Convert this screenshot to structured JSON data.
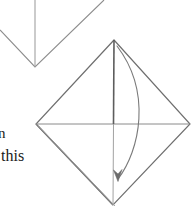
{
  "page": {
    "background_color": "#ffffff",
    "width": 195,
    "height": 208
  },
  "caption": {
    "line_1": "n",
    "line_2": "this",
    "color": "#1a1a1a",
    "note": "clipped caption text at left edge"
  },
  "figures": {
    "previous_step": {
      "name": "partial-figure-top-left",
      "description": "bottom tip of preceding diagram: V shape with vertical crease line",
      "stroke_color": "#8a8a8a",
      "v_left_end": [
        0,
        30
      ],
      "v_apex": [
        35,
        67
      ],
      "v_right_end": [
        104,
        0
      ],
      "crease_top": [
        35,
        0
      ],
      "crease_bottom": [
        35,
        67
      ]
    },
    "main_figure": {
      "name": "diamond-square",
      "description": "rotated square (diamond) with horizontal and vertical center creases and doubled lower-left edge",
      "stroke_color": "#6f6f6f",
      "crease_color": "#8f8f8f",
      "vertex_top": [
        114,
        40
      ],
      "vertex_right": [
        190,
        124
      ],
      "vertex_bottom": [
        113,
        205
      ],
      "vertex_left": [
        36,
        124
      ],
      "horizontal_crease": [
        [
          36,
          124
        ],
        [
          190,
          124
        ]
      ],
      "vertical_crease": [
        [
          114,
          40
        ],
        [
          113,
          205
        ]
      ],
      "doubled_edge": "lower-left"
    },
    "fold_arrow": {
      "name": "curved-fold-arrow",
      "description": "curved arrow from top vertex bulging right and pointing down",
      "stroke_color": "#7a7a7a",
      "start": [
        117,
        46
      ],
      "control_1": [
        152,
        92
      ],
      "control_2": [
        140,
        150
      ],
      "end": [
        118,
        180
      ],
      "arrowhead_direction": "down"
    }
  },
  "colors": {
    "ink": "#6f6f6f",
    "ink_dark": "#555555",
    "ink_light": "#9a9a9a",
    "text": "#1a1a1a",
    "background": "#ffffff"
  }
}
